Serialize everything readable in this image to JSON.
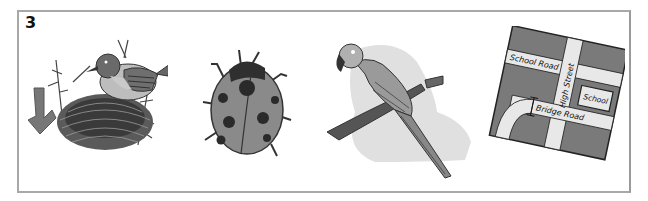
{
  "exercise": {
    "number": "3"
  },
  "pictures": [
    {
      "id": "bird-nest",
      "description": "Bird building a nest, arrow pointing to nest"
    },
    {
      "id": "ladybird",
      "description": "Ladybird with spots"
    },
    {
      "id": "parrot",
      "description": "Parrot perched on a branch"
    },
    {
      "id": "map",
      "description": "Street map",
      "labels": {
        "school_road": "School Road",
        "high_street": "High Street",
        "school": "School",
        "bridge_road": "Bridge Road"
      }
    }
  ],
  "colors": {
    "frame_border": "#a8a8a8",
    "dark": "#3a3a3a",
    "mid": "#7a7a7a",
    "light": "#d0d0d0",
    "shadow": "#e2e2e2"
  }
}
